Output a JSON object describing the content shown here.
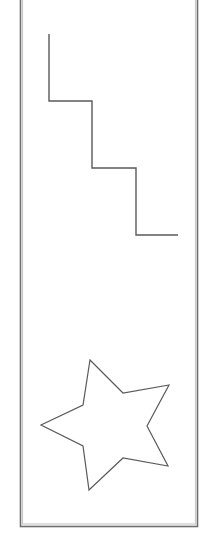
{
  "canvas": {
    "width": 202,
    "height": 538,
    "background": "#ffffff"
  },
  "frame": {
    "outer": {
      "x": 20.5,
      "y": -2,
      "width": 177,
      "height": 528.5,
      "stroke": "#6e6e6e",
      "stroke_width": 1.6
    },
    "inner": {
      "x": 22.5,
      "y": -2,
      "width": 173,
      "height": 526,
      "stroke": "#c8c8c8",
      "stroke_width": 1.2
    }
  },
  "shapes": [
    {
      "id": "staircase",
      "type": "polyline",
      "stroke": "#5a5a5a",
      "stroke_width": 1.4,
      "points": "49,34 49,101 92,101 92,168 136,168 136,235 178,235"
    },
    {
      "id": "star",
      "type": "polygon",
      "stroke": "#5a5a5a",
      "stroke_width": 1.2,
      "fill": "#ffffff",
      "points": "90,360 123,393 169,385 147,426 168,466 123,458 89,490 83,446 41,425 83,405"
    }
  ]
}
